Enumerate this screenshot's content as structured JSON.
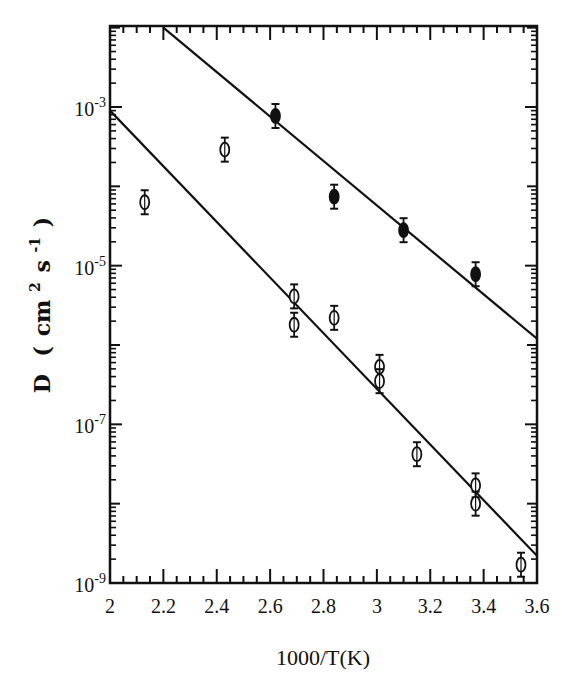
{
  "chart_data": {
    "type": "scatter",
    "title": "",
    "xlabel": "1000/T(K)",
    "ylabel": "D (cm²s⁻¹)",
    "ylabel_parts": {
      "main": "D",
      "open": "(",
      "unit1": "cm",
      "exp1": "2",
      "unit2": "s",
      "exp2": "-1",
      "close": ")"
    },
    "xlim": [
      2,
      3.6
    ],
    "ylim": [
      1e-09,
      0.01
    ],
    "yscale": "log",
    "grid": false,
    "legend": null,
    "x_ticks": [
      "2",
      "2.2",
      "2.4",
      "2.6",
      "2.8",
      "3",
      "3.2",
      "3.4",
      "3.6"
    ],
    "x_tick_values": [
      2,
      2.2,
      2.4,
      2.6,
      2.8,
      3.0,
      3.2,
      3.4,
      3.6
    ],
    "y_ticks": [
      {
        "base": "10",
        "exp": "-3",
        "value": -3
      },
      {
        "base": "10",
        "exp": "-5",
        "value": -5
      },
      {
        "base": "10",
        "exp": "-7",
        "value": -7
      },
      {
        "base": "10",
        "exp": "-9",
        "value": -9
      }
    ],
    "series": [
      {
        "name": "filled",
        "marker": "filled-circle-errorbar",
        "x": [
          2.62,
          2.84,
          3.1,
          3.37
        ],
        "y": [
          0.00077,
          7.4e-05,
          2.8e-05,
          7.8e-06
        ]
      },
      {
        "name": "open",
        "marker": "open-circle-errorbar",
        "x": [
          2.13,
          2.43,
          2.69,
          2.69,
          2.84,
          3.01,
          3.01,
          3.15,
          3.37,
          3.37,
          3.54
        ],
        "y": [
          6.3e-05,
          0.00029,
          4.1e-06,
          1.8e-06,
          2.2e-06,
          5.3e-07,
          3.5e-07,
          4.2e-08,
          1.7e-08,
          1e-08,
          1.7e-09
        ]
      }
    ],
    "fit_lines": [
      {
        "name": "upper-fit",
        "x": [
          2.2,
          3.6
        ],
        "y": [
          0.01,
          1.2e-06
        ]
      },
      {
        "name": "lower-fit",
        "x": [
          2.0,
          3.6
        ],
        "y": [
          0.0009,
          2.2e-09
        ]
      }
    ]
  },
  "colors": {
    "ink": "#111111",
    "background": "#ffffff"
  }
}
